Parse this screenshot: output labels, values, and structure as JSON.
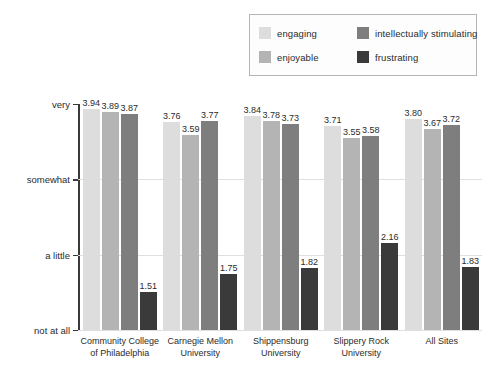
{
  "chart_data": {
    "type": "bar",
    "title": "",
    "subtitle": "",
    "xlabel": "",
    "ylabel": "",
    "grid": true,
    "legend_position": "top-right",
    "categories": [
      "Community College\nof Philadelphia",
      "Carnegie Mellon\nUniversity",
      "Shippensburg\nUniversity",
      "Slippery Rock\nUniversity",
      "All Sites"
    ],
    "category_lines": [
      [
        "Community College",
        "of Philadelphia"
      ],
      [
        "Carnegie Mellon",
        "University"
      ],
      [
        "Shippensburg",
        "University"
      ],
      [
        "Slippery Rock",
        "University"
      ],
      [
        "All Sites"
      ]
    ],
    "series": [
      {
        "name": "engaging",
        "color": "#dddddd",
        "values": [
          3.94,
          3.76,
          3.84,
          3.71,
          3.8
        ]
      },
      {
        "name": "enjoyable",
        "color": "#b4b4b4",
        "values": [
          3.89,
          3.59,
          3.78,
          3.55,
          3.67
        ]
      },
      {
        "name": "intellectually stimulating",
        "color": "#7e7e7e",
        "values": [
          3.87,
          3.77,
          3.73,
          3.58,
          3.72
        ]
      },
      {
        "name": "frustrating",
        "color": "#3a3a3a",
        "values": [
          1.51,
          1.75,
          1.82,
          2.16,
          1.83
        ]
      }
    ],
    "ylim": [
      1,
      4
    ],
    "ytick_values": [
      4,
      3,
      2,
      1
    ],
    "ytick_labels": [
      "very",
      "somewhat",
      "a little",
      "not at all"
    ],
    "value_label_format": "2dp"
  },
  "legend": {
    "items": [
      {
        "label": "engaging",
        "color": "#dddddd"
      },
      {
        "label": "intellectually stimulating",
        "color": "#7e7e7e"
      },
      {
        "label": "enjoyable",
        "color": "#b4b4b4"
      },
      {
        "label": "frustrating",
        "color": "#3a3a3a"
      }
    ]
  },
  "colors": {
    "axis": "#3a3a3a",
    "gridline": "#e2dede",
    "background": "#ffffff",
    "legend_border": "#b5b5b5",
    "text": "#2b2b2b"
  }
}
